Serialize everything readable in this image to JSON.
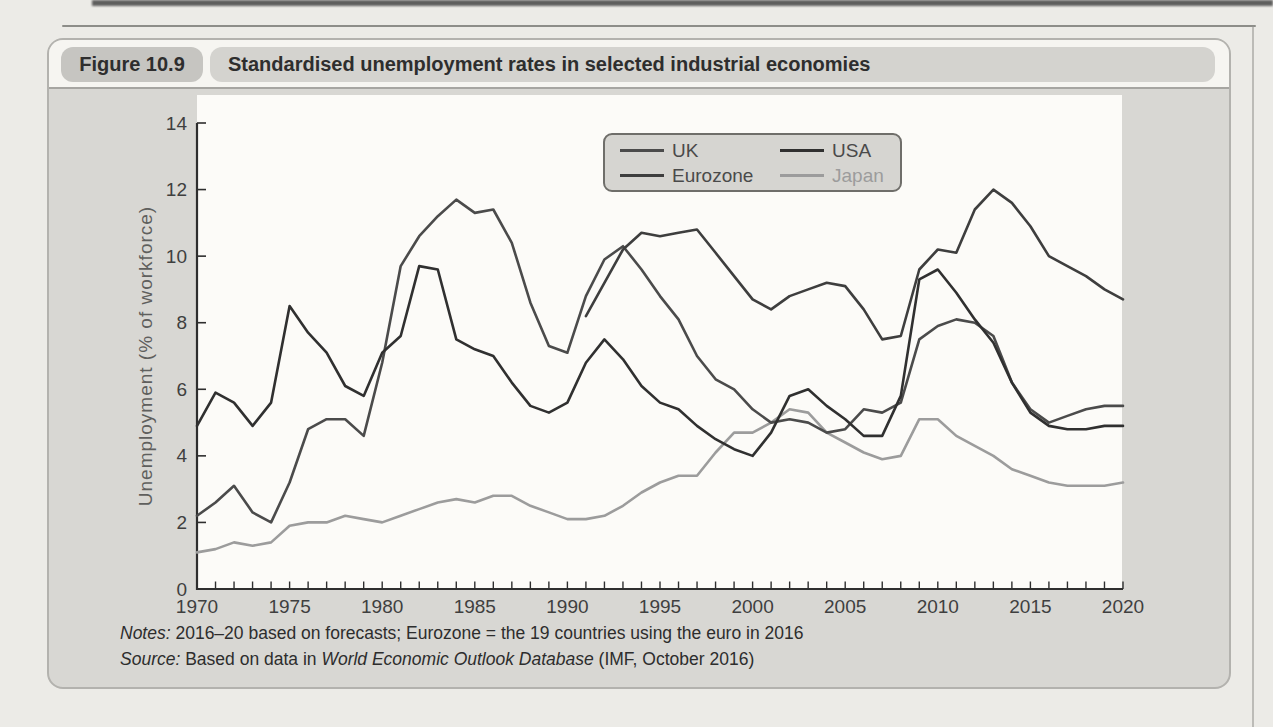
{
  "figure": {
    "label": "Figure 10.9",
    "title": "Standardised unemployment rates in selected industrial economies"
  },
  "chart_data": {
    "type": "line",
    "title": "Standardised unemployment rates in selected industrial economies",
    "xlabel": "",
    "ylabel": "Unemployment (% of workforce)",
    "xlim": [
      1970,
      2020
    ],
    "ylim": [
      0,
      14
    ],
    "x_ticks": [
      1970,
      1975,
      1980,
      1985,
      1990,
      1995,
      2000,
      2005,
      2010,
      2015,
      2020
    ],
    "y_ticks": [
      0,
      2,
      4,
      6,
      8,
      10,
      12,
      14
    ],
    "x_minor_tick_every": 1,
    "grid": false,
    "legend_position": "top-center",
    "axis_color": "#2e2e2e",
    "tick_label_color": "#3f3f3f",
    "plot_background": "#fcfbf8",
    "series": [
      {
        "name": "UK",
        "color": "#4b4b4b",
        "label_color": "#4a4a4a",
        "x_start": 1970,
        "values": [
          2.2,
          2.6,
          3.1,
          2.3,
          2.0,
          3.2,
          4.8,
          5.1,
          5.1,
          4.6,
          6.8,
          9.7,
          10.6,
          11.2,
          11.7,
          11.3,
          11.4,
          10.4,
          8.6,
          7.3,
          7.1,
          8.8,
          9.9,
          10.3,
          9.6,
          8.8,
          8.1,
          7.0,
          6.3,
          6.0,
          5.4,
          5.0,
          5.1,
          5.0,
          4.7,
          4.8,
          5.4,
          5.3,
          5.6,
          7.5,
          7.9,
          8.1,
          8.0,
          7.6,
          6.2,
          5.4,
          5.0,
          5.2,
          5.4,
          5.5,
          5.5
        ]
      },
      {
        "name": "USA",
        "color": "#303030",
        "label_color": "#4a4a4a",
        "x_start": 1970,
        "values": [
          4.9,
          5.9,
          5.6,
          4.9,
          5.6,
          8.5,
          7.7,
          7.1,
          6.1,
          5.8,
          7.1,
          7.6,
          9.7,
          9.6,
          7.5,
          7.2,
          7.0,
          6.2,
          5.5,
          5.3,
          5.6,
          6.8,
          7.5,
          6.9,
          6.1,
          5.6,
          5.4,
          4.9,
          4.5,
          4.2,
          4.0,
          4.7,
          5.8,
          6.0,
          5.5,
          5.1,
          4.6,
          4.6,
          5.8,
          9.3,
          9.6,
          8.9,
          8.1,
          7.4,
          6.2,
          5.3,
          4.9,
          4.8,
          4.8,
          4.9,
          4.9
        ]
      },
      {
        "name": "Eurozone",
        "color": "#3e3e3e",
        "label_color": "#4a4a4a",
        "x_start": 1991,
        "values": [
          8.2,
          9.2,
          10.2,
          10.7,
          10.6,
          10.7,
          10.8,
          10.1,
          9.4,
          8.7,
          8.4,
          8.8,
          9.0,
          9.2,
          9.1,
          8.4,
          7.5,
          7.6,
          9.6,
          10.2,
          10.1,
          11.4,
          12.0,
          11.6,
          10.9,
          10.0,
          9.7,
          9.4,
          9.0,
          8.7
        ]
      },
      {
        "name": "Japan",
        "color": "#9c9c9c",
        "label_color": "#9c9c9c",
        "x_start": 1970,
        "values": [
          1.1,
          1.2,
          1.4,
          1.3,
          1.4,
          1.9,
          2.0,
          2.0,
          2.2,
          2.1,
          2.0,
          2.2,
          2.4,
          2.6,
          2.7,
          2.6,
          2.8,
          2.8,
          2.5,
          2.3,
          2.1,
          2.1,
          2.2,
          2.5,
          2.9,
          3.2,
          3.4,
          3.4,
          4.1,
          4.7,
          4.7,
          5.0,
          5.4,
          5.3,
          4.7,
          4.4,
          4.1,
          3.9,
          4.0,
          5.1,
          5.1,
          4.6,
          4.3,
          4.0,
          3.6,
          3.4,
          3.2,
          3.1,
          3.1,
          3.1,
          3.2
        ]
      }
    ]
  },
  "notes": {
    "notes_label": "Notes:",
    "notes_text": " 2016–20 based on forecasts; Eurozone = the 19 countries using the euro in 2016",
    "source_label": "Source:",
    "source_prefix": " Based on data in ",
    "source_italic": "World Economic Outlook Database",
    "source_suffix": " (IMF, October 2016)"
  }
}
